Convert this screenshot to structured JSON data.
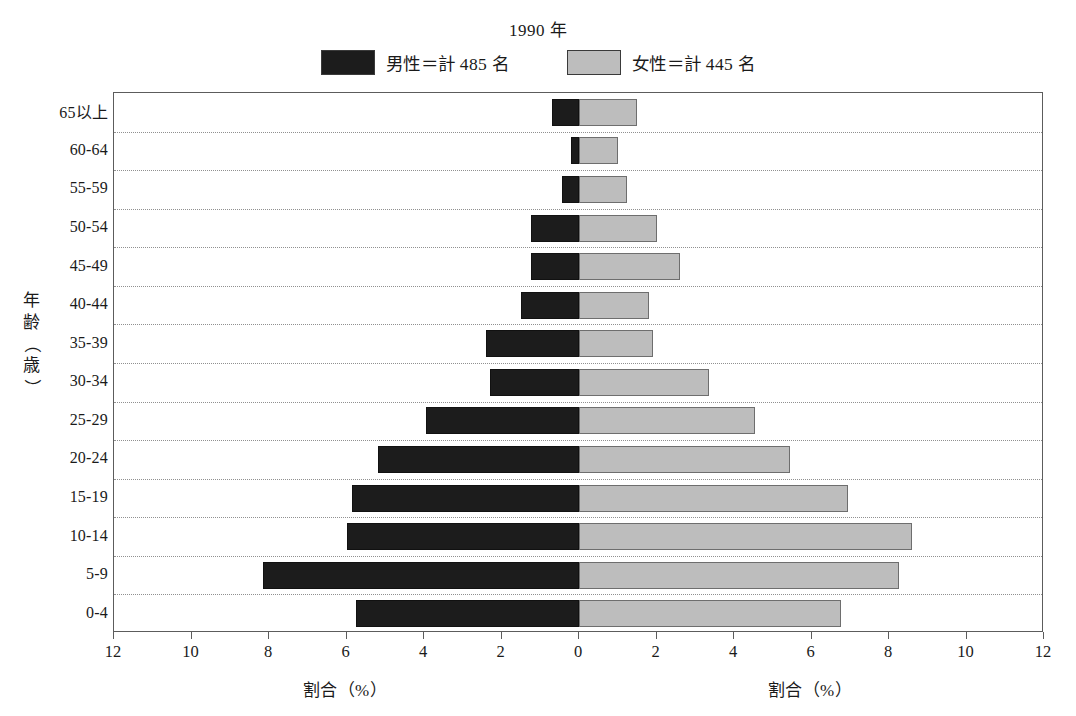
{
  "chart_data": {
    "type": "bar",
    "subtype": "population-pyramid",
    "title": "1990 年",
    "xlabel": "割合（%）",
    "ylabel": "年齢（歳）",
    "xlim": [
      -12,
      12
    ],
    "xticks": [
      12,
      10,
      8,
      6,
      4,
      2,
      0,
      2,
      4,
      6,
      8,
      10,
      12
    ],
    "grid": true,
    "grid_orientation": "horizontal",
    "legend_position": "top",
    "categories": [
      "0-4",
      "5-9",
      "10-14",
      "15-19",
      "20-24",
      "25-29",
      "30-34",
      "35-39",
      "40-44",
      "45-49",
      "50-54",
      "55-59",
      "60-64",
      "65以上"
    ],
    "series": [
      {
        "name": "男性＝計 485 名",
        "short_name": "男性",
        "side": "left",
        "color": "#1c1c1c",
        "total": 485,
        "values": [
          5.75,
          8.15,
          6.0,
          5.85,
          5.2,
          3.95,
          2.3,
          2.4,
          1.5,
          1.25,
          1.25,
          0.45,
          0.2,
          0.7
        ]
      },
      {
        "name": "女性＝計 445 名",
        "short_name": "女性",
        "side": "right",
        "color": "#bdbdbd",
        "total": 445,
        "values": [
          6.75,
          8.25,
          8.6,
          6.95,
          5.45,
          4.55,
          3.35,
          1.9,
          1.8,
          2.6,
          2.0,
          1.25,
          1.0,
          1.5
        ]
      }
    ]
  },
  "header": {
    "title": "1990 年"
  },
  "legend": {
    "items": [
      {
        "label": "男性＝計 485 名",
        "color": "#1c1c1c"
      },
      {
        "label": "女性＝計 445 名",
        "color": "#bdbdbd"
      }
    ]
  },
  "axes": {
    "y_title_chars": [
      "年",
      "齢",
      "（",
      "歳",
      "）"
    ],
    "x_title_left": "割合（%）",
    "x_title_right": "割合（%）"
  }
}
